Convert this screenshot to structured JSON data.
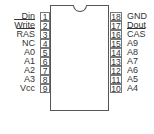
{
  "diagram": {
    "type": "ic-pinout",
    "package": "18-pin DIP",
    "left_pins": [
      {
        "num": "1",
        "label": "Din",
        "overline": false
      },
      {
        "num": "2",
        "label": "Write",
        "overline": true
      },
      {
        "num": "3",
        "label": "RAS",
        "overline": true
      },
      {
        "num": "4",
        "label": "NC",
        "overline": false
      },
      {
        "num": "5",
        "label": "A0",
        "overline": false
      },
      {
        "num": "6",
        "label": "A1",
        "overline": false
      },
      {
        "num": "7",
        "label": "A2",
        "overline": false
      },
      {
        "num": "8",
        "label": "A3",
        "overline": false
      },
      {
        "num": "9",
        "label": "Vcc",
        "overline": false
      }
    ],
    "right_pins": [
      {
        "num": "18",
        "label": "GND",
        "overline": false
      },
      {
        "num": "17",
        "label": "Dout",
        "overline": false
      },
      {
        "num": "16",
        "label": "CAS",
        "overline": true
      },
      {
        "num": "15",
        "label": "A9",
        "overline": false
      },
      {
        "num": "14",
        "label": "A8",
        "overline": false
      },
      {
        "num": "13",
        "label": "A7",
        "overline": false
      },
      {
        "num": "12",
        "label": "A6",
        "overline": false
      },
      {
        "num": "11",
        "label": "A5",
        "overline": false
      },
      {
        "num": "10",
        "label": "A4",
        "overline": false
      }
    ]
  }
}
